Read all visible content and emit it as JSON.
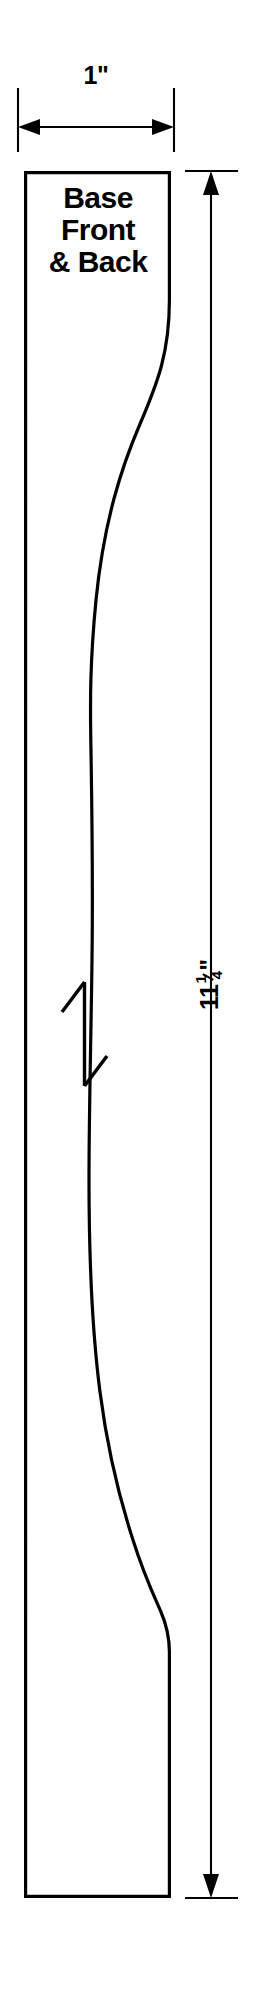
{
  "drawing": {
    "type": "woodworking-cut-template",
    "canvas": {
      "width": 276,
      "height": 2008,
      "background": "#ffffff"
    },
    "line_color": "#000000",
    "part": {
      "name": "Base Front & Back",
      "label_lines": [
        "Base",
        "Front",
        "& Back"
      ],
      "outline_description": "Tall narrow board, straight left edge, S-curved (ogee) right edge, flat top and bottom"
    },
    "dimensions": [
      {
        "id": "width",
        "label": "1\"",
        "value": 1,
        "unit": "inch",
        "orientation": "horizontal",
        "position": "top",
        "arrows": "both-ends"
      },
      {
        "id": "height",
        "label_whole": "11",
        "label_numerator": "1",
        "label_denominator": "4",
        "label_unit": "\"",
        "label": "11¼\"",
        "value": 11.25,
        "unit": "inch",
        "orientation": "vertical",
        "position": "right",
        "text_rotation_deg": -90,
        "arrows": "both-ends"
      }
    ],
    "annotations": [
      {
        "id": "grain-direction",
        "symbol": "double-headed-arrow",
        "meaning": "grain direction",
        "orientation": "vertical"
      }
    ]
  }
}
